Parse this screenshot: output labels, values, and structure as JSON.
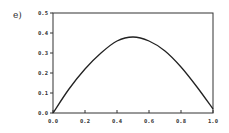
{
  "panel_label": "e)",
  "chart_data": {
    "type": "line",
    "title": "",
    "xlabel": "",
    "ylabel": "",
    "xlim": [
      0.0,
      1.0
    ],
    "ylim": [
      0.0,
      0.5
    ],
    "grid": false,
    "legend": null,
    "x_ticks": [
      "0.0",
      "0.2",
      "0.4",
      "0.6",
      "0.8",
      "1.0"
    ],
    "y_ticks": [
      "0.0",
      "0.1",
      "0.2",
      "0.3",
      "0.4",
      "0.5"
    ],
    "series": [
      {
        "name": "curve",
        "x": [
          0.0,
          0.1,
          0.2,
          0.3,
          0.4,
          0.5,
          0.6,
          0.7,
          0.8,
          0.9,
          1.0
        ],
        "y": [
          0.0,
          0.12,
          0.22,
          0.3,
          0.36,
          0.38,
          0.36,
          0.31,
          0.23,
          0.13,
          0.02
        ]
      }
    ],
    "color": "#222222"
  }
}
